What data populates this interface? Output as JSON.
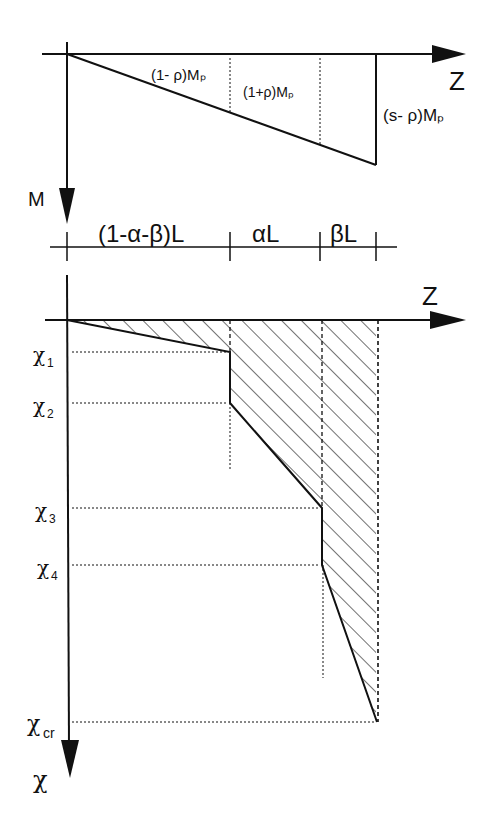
{
  "top_diagram": {
    "axis_z_label": "Z",
    "axis_m_label": "M",
    "moment_labels": [
      "(1- ρ)Mₚ",
      "(1+ρ)Mₚ",
      "(s- ρ)Mₚ"
    ]
  },
  "dimensions": {
    "segments": [
      "(1-α-β)L",
      "αL",
      "βL"
    ]
  },
  "bottom_diagram": {
    "axis_z_label": "Z",
    "axis_chi_label": "χ",
    "curvature_labels": [
      {
        "base": "χ",
        "sub": "1"
      },
      {
        "base": "χ",
        "sub": "2"
      },
      {
        "base": "χ",
        "sub": "3"
      },
      {
        "base": "χ",
        "sub": "4"
      },
      {
        "base": "χ",
        "sub": "cr"
      }
    ]
  },
  "colors": {
    "ink": "#111111",
    "paper": "#ffffff"
  }
}
